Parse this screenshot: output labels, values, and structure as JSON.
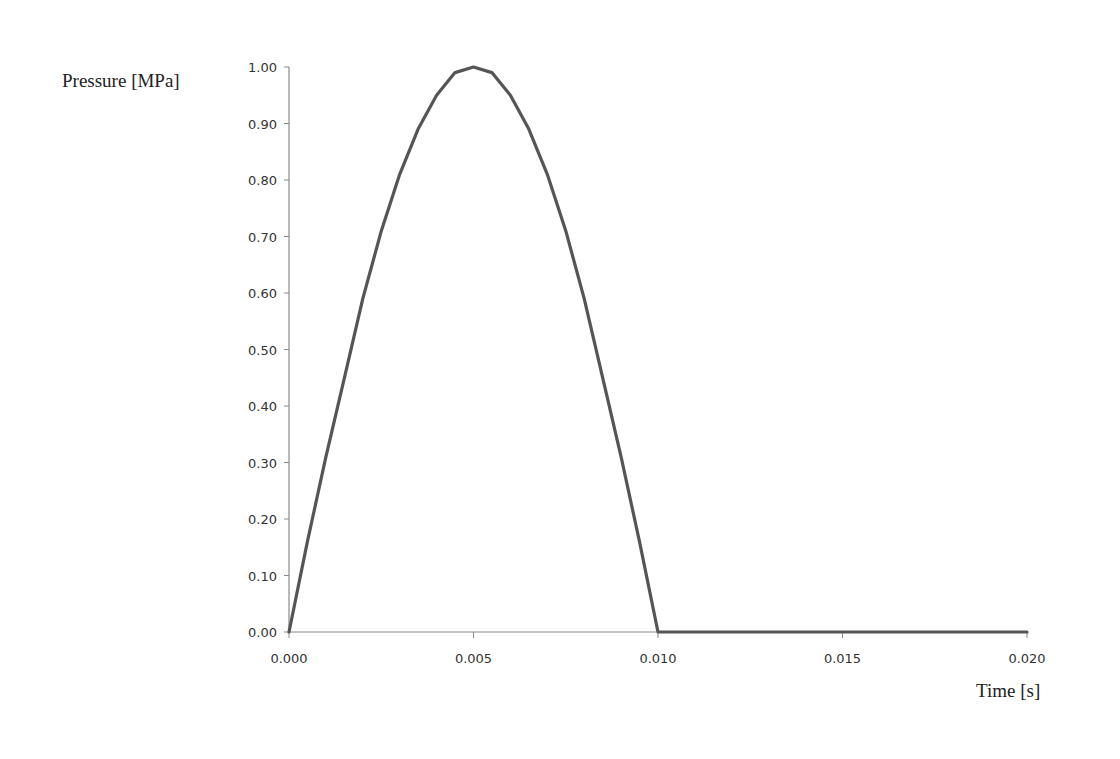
{
  "chart_data": {
    "type": "line",
    "title": "",
    "xlabel": "Time [s]",
    "ylabel": "Pressure [MPa]",
    "xlim": [
      0.0,
      0.02
    ],
    "ylim": [
      0.0,
      1.0
    ],
    "grid": false,
    "legend": null,
    "x_ticks": [
      "0.000",
      "0.005",
      "0.010",
      "0.015",
      "0.020"
    ],
    "y_ticks": [
      "0.00",
      "0.10",
      "0.20",
      "0.30",
      "0.40",
      "0.50",
      "0.60",
      "0.70",
      "0.80",
      "0.90",
      "1.00"
    ],
    "series": [
      {
        "name": "Pressure",
        "color": "#555555",
        "x": [
          0.0,
          0.0005,
          0.001,
          0.0015,
          0.002,
          0.0025,
          0.003,
          0.0035,
          0.004,
          0.0045,
          0.005,
          0.0055,
          0.006,
          0.0065,
          0.007,
          0.0075,
          0.008,
          0.0085,
          0.009,
          0.0095,
          0.01,
          0.015,
          0.02
        ],
        "values": [
          0.0,
          0.16,
          0.31,
          0.45,
          0.59,
          0.71,
          0.81,
          0.89,
          0.95,
          0.99,
          1.0,
          0.99,
          0.95,
          0.89,
          0.81,
          0.71,
          0.59,
          0.45,
          0.31,
          0.16,
          0.0,
          0.0,
          0.0
        ]
      }
    ]
  },
  "labels": {
    "ylabel": "Pressure [MPa]",
    "xlabel": "Time [s]"
  },
  "colors": {
    "line": "#555555",
    "axis": "#8a8a8a",
    "text": "#333333"
  }
}
